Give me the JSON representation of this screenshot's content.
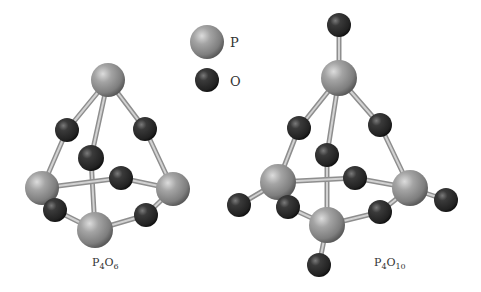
{
  "legend": {
    "items": [
      {
        "element": "P",
        "label": "P",
        "cx": 207,
        "cy": 42,
        "r": 17
      },
      {
        "element": "O",
        "label": "O",
        "cx": 207,
        "cy": 80,
        "r": 12
      }
    ]
  },
  "colors": {
    "phosphorus_base": "#9a9a9a",
    "phosphorus_highlight": "#d6d6d6",
    "phosphorus_shadow": "#5a5a5a",
    "oxygen_base": "#2e2e2e",
    "oxygen_highlight": "#7a7a7a",
    "oxygen_shadow": "#0f0f0f",
    "bond": "#b0b0b0",
    "label": "#333333"
  },
  "molecules": [
    {
      "id": "p4o6",
      "label_base": "P",
      "label_sub1": "4",
      "label_mid": "O",
      "label_sub2": "6",
      "label_x": 92,
      "label_y": 266,
      "atoms": [
        {
          "id": "P1",
          "el": "P",
          "cx": 108,
          "cy": 80,
          "r": 17
        },
        {
          "id": "P2",
          "el": "P",
          "cx": 42,
          "cy": 188,
          "r": 17
        },
        {
          "id": "P3",
          "el": "P",
          "cx": 173,
          "cy": 189,
          "r": 17
        },
        {
          "id": "P4",
          "el": "P",
          "cx": 95,
          "cy": 230,
          "r": 18
        },
        {
          "id": "O1",
          "el": "O",
          "cx": 67,
          "cy": 130,
          "r": 12
        },
        {
          "id": "O2",
          "el": "O",
          "cx": 145,
          "cy": 129,
          "r": 12
        },
        {
          "id": "O3",
          "el": "O",
          "cx": 91,
          "cy": 158,
          "r": 13
        },
        {
          "id": "O4",
          "el": "O",
          "cx": 121,
          "cy": 178,
          "r": 12
        },
        {
          "id": "O5",
          "el": "O",
          "cx": 55,
          "cy": 210,
          "r": 12
        },
        {
          "id": "O6",
          "el": "O",
          "cx": 146,
          "cy": 215,
          "r": 12
        }
      ],
      "bonds": [
        [
          "P1",
          "O1"
        ],
        [
          "O1",
          "P2"
        ],
        [
          "P1",
          "O2"
        ],
        [
          "O2",
          "P3"
        ],
        [
          "P1",
          "O3"
        ],
        [
          "O3",
          "P4"
        ],
        [
          "P2",
          "O4"
        ],
        [
          "O4",
          "P3"
        ],
        [
          "P2",
          "O5"
        ],
        [
          "O5",
          "P4"
        ],
        [
          "P3",
          "O6"
        ],
        [
          "O6",
          "P4"
        ]
      ],
      "draw_order": [
        "P2",
        "O4",
        "P3",
        "O1",
        "O2",
        "P1",
        "O3",
        "O5",
        "O6",
        "P4"
      ]
    },
    {
      "id": "p4o10",
      "label_base": "P",
      "label_sub1": "4",
      "label_mid": "O",
      "label_sub2": "10",
      "label_x": 374,
      "label_y": 266,
      "atoms": [
        {
          "id": "P1",
          "el": "P",
          "cx": 339,
          "cy": 78,
          "r": 18
        },
        {
          "id": "P2",
          "el": "P",
          "cx": 278,
          "cy": 182,
          "r": 18
        },
        {
          "id": "P3",
          "el": "P",
          "cx": 410,
          "cy": 188,
          "r": 18
        },
        {
          "id": "P4",
          "el": "P",
          "cx": 327,
          "cy": 225,
          "r": 18
        },
        {
          "id": "O1",
          "el": "O",
          "cx": 299,
          "cy": 128,
          "r": 12
        },
        {
          "id": "O2",
          "el": "O",
          "cx": 380,
          "cy": 125,
          "r": 12
        },
        {
          "id": "O3",
          "el": "O",
          "cx": 327,
          "cy": 155,
          "r": 12
        },
        {
          "id": "O4",
          "el": "O",
          "cx": 355,
          "cy": 178,
          "r": 12
        },
        {
          "id": "O5",
          "el": "O",
          "cx": 288,
          "cy": 207,
          "r": 12
        },
        {
          "id": "O6",
          "el": "O",
          "cx": 380,
          "cy": 212,
          "r": 12
        },
        {
          "id": "T1",
          "el": "O",
          "cx": 339,
          "cy": 25,
          "r": 12
        },
        {
          "id": "T2",
          "el": "O",
          "cx": 239,
          "cy": 205,
          "r": 12
        },
        {
          "id": "T3",
          "el": "O",
          "cx": 446,
          "cy": 200,
          "r": 12
        },
        {
          "id": "T4",
          "el": "O",
          "cx": 319,
          "cy": 265,
          "r": 12
        }
      ],
      "bonds": [
        [
          "P1",
          "O1"
        ],
        [
          "O1",
          "P2"
        ],
        [
          "P1",
          "O2"
        ],
        [
          "O2",
          "P3"
        ],
        [
          "P1",
          "O3"
        ],
        [
          "O3",
          "P4"
        ],
        [
          "P2",
          "O4"
        ],
        [
          "O4",
          "P3"
        ],
        [
          "P2",
          "O5"
        ],
        [
          "O5",
          "P4"
        ],
        [
          "P3",
          "O6"
        ],
        [
          "O6",
          "P4"
        ],
        [
          "P1",
          "T1"
        ],
        [
          "P2",
          "T2"
        ],
        [
          "P3",
          "T3"
        ],
        [
          "P4",
          "T4"
        ]
      ],
      "draw_order": [
        "O4",
        "P2",
        "P3",
        "T1",
        "O1",
        "O2",
        "P1",
        "O3",
        "T2",
        "T3",
        "O5",
        "O6",
        "P4",
        "T4"
      ]
    }
  ]
}
